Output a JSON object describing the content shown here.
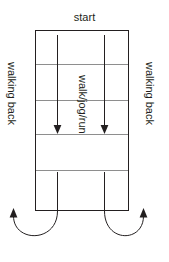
{
  "diagram": {
    "title_label": "start",
    "center_label": "walk/jog/run",
    "left_label": "walking back",
    "right_label": "walking back",
    "colors": {
      "stroke": "#231f20",
      "divider": "#8e8e8e",
      "background": "#ffffff",
      "text": "#231f20"
    },
    "geometry": {
      "field_left": 35,
      "field_right": 129,
      "field_top": 30,
      "field_bottom": 210,
      "divider_rows": [
        64,
        100,
        134,
        170
      ],
      "lane_x": [
        57,
        104
      ],
      "arrow_down_top": 35,
      "arrow_down_bottom": 134,
      "return_line_top": 172,
      "return_line_bottom": 210
    },
    "elements": [
      {
        "name": "field-rectangle",
        "type": "rect"
      },
      {
        "name": "divider-line-1",
        "type": "line"
      },
      {
        "name": "divider-line-2",
        "type": "line"
      },
      {
        "name": "divider-line-3",
        "type": "line"
      },
      {
        "name": "divider-line-4",
        "type": "line"
      },
      {
        "name": "down-arrow-left",
        "type": "arrow",
        "direction": "down"
      },
      {
        "name": "down-arrow-right",
        "type": "arrow",
        "direction": "down"
      },
      {
        "name": "return-line-left",
        "type": "line"
      },
      {
        "name": "return-line-right",
        "type": "line"
      },
      {
        "name": "u-turn-arrow-left",
        "type": "curved-arrow",
        "direction": "up"
      },
      {
        "name": "u-turn-arrow-right",
        "type": "curved-arrow",
        "direction": "up"
      }
    ]
  }
}
